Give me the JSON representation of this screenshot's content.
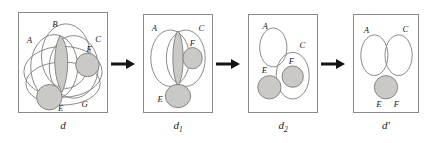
{
  "figure": {
    "kind": "set-diagram-transformation-sequence",
    "panel_count": 4,
    "arrow_count": 3,
    "background_color": "#ffffff",
    "curve_stroke_color": "#7a7a7a",
    "shaded_fill_color": "#cbc9c6",
    "panel_border_color": "#8a8a8a",
    "label_color": "#1a1a1a"
  },
  "panels": [
    {
      "id": "panel-d",
      "caption": "d",
      "caption_sub": "",
      "caption_prime": "",
      "region_labels": [
        "A",
        "B",
        "C",
        "F",
        "E",
        "G"
      ],
      "shaded_regions": [
        "central-lens",
        "F",
        "E"
      ],
      "labels": [
        {
          "text": "B",
          "x": 34,
          "y": 14
        },
        {
          "text": "A",
          "x": 10,
          "y": 31
        },
        {
          "text": "C",
          "x": 78,
          "y": 30
        },
        {
          "text": "F",
          "x": 70,
          "y": 42
        },
        {
          "text": "E",
          "x": 38,
          "y": 101
        },
        {
          "text": "G",
          "x": 63,
          "y": 97
        }
      ]
    },
    {
      "id": "panel-d1",
      "caption": "d",
      "caption_sub": "1",
      "caption_prime": "",
      "region_labels": [
        "A",
        "C",
        "F",
        "E"
      ],
      "shaded_regions": [
        "A-C-lens",
        "F",
        "E"
      ],
      "labels": [
        {
          "text": "A",
          "x": 9,
          "y": 15
        },
        {
          "text": "C",
          "x": 55,
          "y": 14
        },
        {
          "text": "F",
          "x": 46,
          "y": 32
        },
        {
          "text": "E",
          "x": 17,
          "y": 84
        }
      ]
    },
    {
      "id": "panel-d2",
      "caption": "d",
      "caption_sub": "2",
      "caption_prime": "",
      "region_labels": [
        "A",
        "C",
        "F",
        "E"
      ],
      "shaded_regions": [
        "F",
        "E"
      ],
      "labels": [
        {
          "text": "A",
          "x": 14,
          "y": 14
        },
        {
          "text": "C",
          "x": 52,
          "y": 34
        },
        {
          "text": "F",
          "x": 41,
          "y": 50
        },
        {
          "text": "E",
          "x": 14,
          "y": 62
        }
      ]
    },
    {
      "id": "panel-dprime",
      "caption": "d",
      "caption_sub": "",
      "caption_prime": "′",
      "region_labels": [
        "A",
        "C",
        "E",
        "F"
      ],
      "shaded_regions": [
        "EF"
      ],
      "labels": [
        {
          "text": "A",
          "x": 12,
          "y": 17
        },
        {
          "text": "C",
          "x": 54,
          "y": 16
        },
        {
          "text": "E",
          "x": 26,
          "y": 89
        },
        {
          "text": "F",
          "x": 44,
          "y": 89
        }
      ]
    }
  ],
  "arrows": [
    {
      "id": "arrow-1",
      "direction": "right"
    },
    {
      "id": "arrow-2",
      "direction": "right"
    },
    {
      "id": "arrow-3",
      "direction": "right"
    }
  ]
}
